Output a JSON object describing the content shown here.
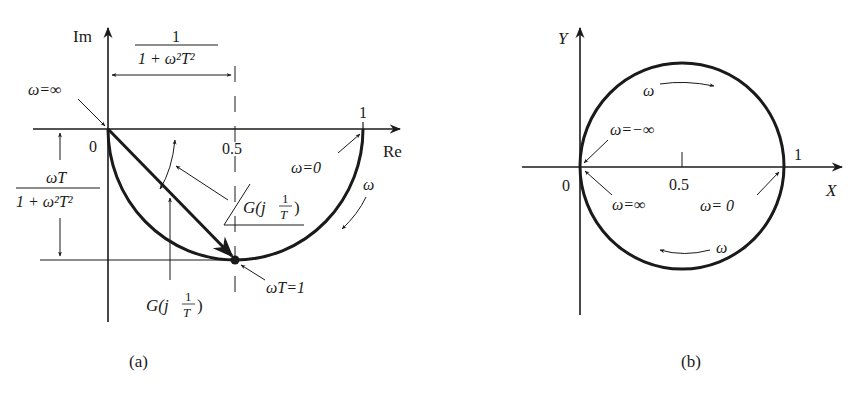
{
  "figure_a": {
    "caption": "(a)",
    "axes": {
      "x_label": "Re",
      "y_label": "Im"
    },
    "ticks": {
      "origin": "0",
      "half": "0.5",
      "one": "1"
    },
    "top_dimension": {
      "numerator": "1",
      "denominator": "1 + ω²T²"
    },
    "left_dimension": {
      "numerator": "ωT",
      "denominator": "1 + ω²T²"
    },
    "labels": {
      "omega_inf": "ω=∞",
      "omega_zero": "ω=0",
      "omega_dir": "ω",
      "omega_T_1": "ωT=1",
      "angle_G": "∠G(j 1/T)",
      "mag_G": "G(j 1/T)"
    }
  },
  "figure_b": {
    "caption": "(b)",
    "axes": {
      "x_label": "X",
      "y_label": "Y"
    },
    "ticks": {
      "origin": "0",
      "half": "0.5",
      "one": "1"
    },
    "labels": {
      "omega_neg_inf": "ω=−∞",
      "omega_inf": "ω=∞",
      "omega_zero": "ω= 0",
      "omega_top": "ω",
      "omega_bottom": "ω"
    }
  }
}
